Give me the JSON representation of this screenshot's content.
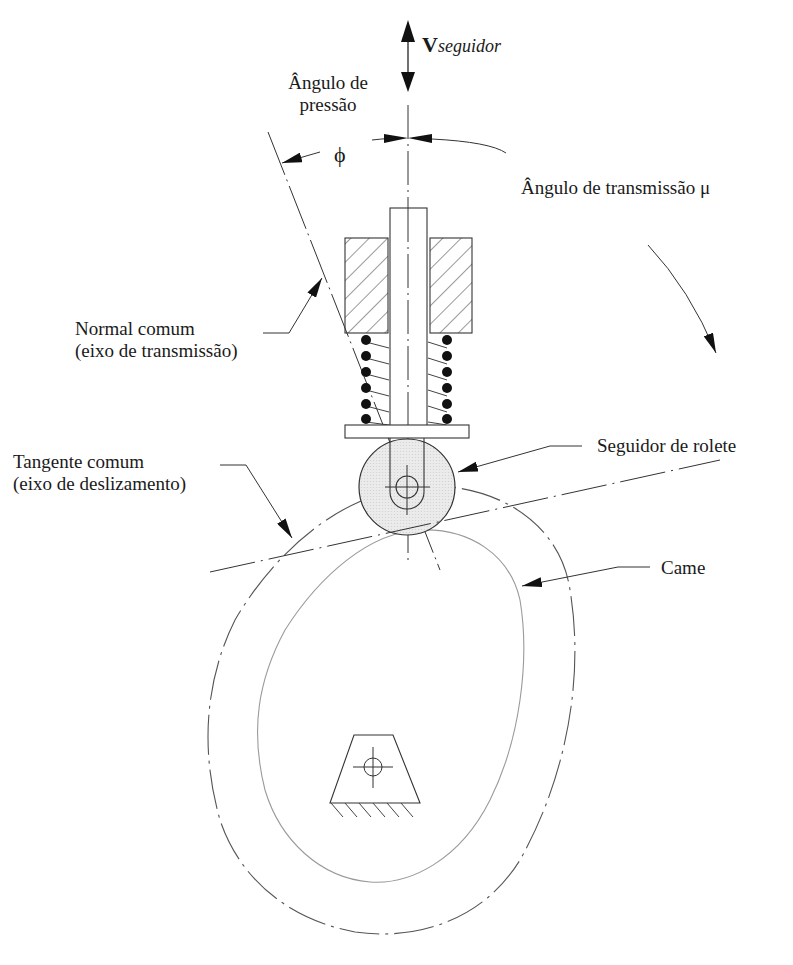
{
  "figure": {
    "type": "cam-follower-diagram",
    "labels": {
      "velocity_main": "V",
      "velocity_sub": "seguidor",
      "pressure_angle_line1": "Ângulo de",
      "pressure_angle_line2": "pressão",
      "phi_symbol": "ϕ",
      "transmission_angle": "Ângulo de transmissão μ",
      "common_normal_line1": "Normal comum",
      "common_normal_line2": "(eixo de transmissão)",
      "common_tangent_line1": "Tangente comum",
      "common_tangent_line2": "(eixo de deslizamento)",
      "roller_follower": "Seguidor de rolete",
      "cam": "Came"
    },
    "colors": {
      "stroke": "#2a2a2a",
      "cam_profile": "#9a9a9a",
      "pitch_curve": "#555555",
      "roller_fill": "#e6e6e6",
      "text": "#1a1a1a"
    }
  }
}
